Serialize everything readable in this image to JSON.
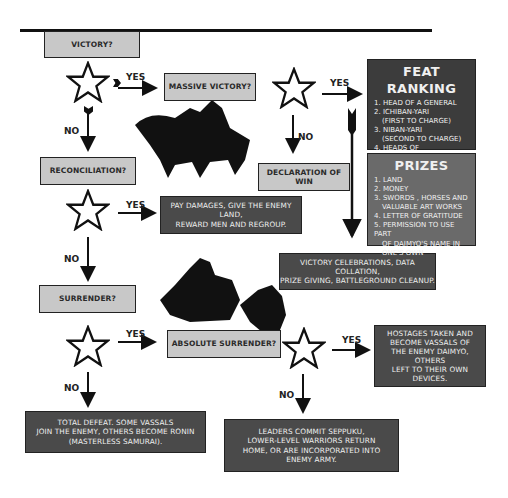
{
  "nodes": {
    "victory": "VICTORY?",
    "massive_victory": "MASSIVE VICTORY?",
    "reconciliation": "RECONCILIATION?",
    "declaration_of_win": "DECLARATION OF WIN",
    "pay_damages": [
      "PAY DAMAGES, GIVE THE ENEMY LAND,",
      "REWARD MEN AND REGROUP."
    ],
    "victory_celebrations": [
      "VICTORY CELEBRATIONS, DATA COLLATION,",
      "PRIZE GIVING, BATTLEGROUND CLEANUP."
    ],
    "surrender": "SURRENDER?",
    "absolute_surrender": "ABSOLUTE SURRENDER?",
    "hostages": [
      "HOSTAGES TAKEN AND",
      "BECOME VASSALS OF",
      "THE ENEMY DAIMYO, OTHERS",
      "LEFT TO THEIR OWN DEVICES."
    ],
    "total_defeat": [
      "TOTAL DEFEAT. SOME VASSALS",
      "JOIN THE ENEMY, OTHERS BECOME RONIN",
      "(MASTERLESS SAMURAI)."
    ],
    "seppuku": [
      "LEADERS COMMIT SEPPUKU,",
      "LOWER-LEVEL WARRIORS RETURN",
      "HOME, OR ARE INCORPORATED INTO",
      "ENEMY ARMY."
    ]
  },
  "feat_ranking": {
    "title": "FEAT RANKING",
    "items": [
      "1. HEAD OF A GENERAL",
      "2. ICHIBAN-YARI",
      "   (FIRST TO CHARGE)",
      "3. NIBAN-YARI",
      "   (SECOND TO CHARGE)",
      "4. HEADS OF COMMANDERS",
      "5. OTHER HEADS, NOSES..."
    ]
  },
  "prizes": {
    "title": "PRIZES",
    "items": [
      "1. LAND",
      "2. MONEY",
      "3. SWORDS , HORSES AND",
      "   VALUABLE ART WORKS",
      "4. LETTER OF GRATITUDE",
      "5. PERMISSION TO USE PART",
      "   OF DAIMYO'S NAME IN",
      "   ONE'S OWN"
    ]
  },
  "labels": {
    "yes": "YES",
    "no": "NO"
  },
  "colors": {
    "light_box": "#c8c8c8",
    "dark_box": "#4a4a4a",
    "mid_box": "#666666",
    "line": "#111111"
  }
}
